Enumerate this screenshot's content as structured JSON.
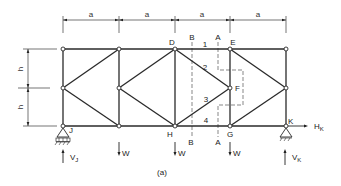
{
  "figure": {
    "caption": "(a)",
    "dimensions": {
      "horizontal_label": "a",
      "horizontal_count": 4,
      "vertical_label": "h",
      "vertical_count": 2
    },
    "nodes": {
      "D": "D",
      "E": "E",
      "F": "F",
      "G": "G",
      "H": "H",
      "J": "J",
      "K": "K"
    },
    "members": {
      "m1": "1",
      "m2": "2",
      "m3": "3",
      "m4": "4"
    },
    "sections": {
      "A_top": "A",
      "A_bottom": "A",
      "B_top": "B",
      "B_bottom": "B"
    },
    "loads": {
      "w1": "W",
      "w2": "W",
      "w3": "W"
    },
    "reactions": {
      "VJ_main": "V",
      "VJ_sub": "J",
      "VK_main": "V",
      "VK_sub": "K",
      "HK_main": "H",
      "HK_sub": "K"
    }
  }
}
